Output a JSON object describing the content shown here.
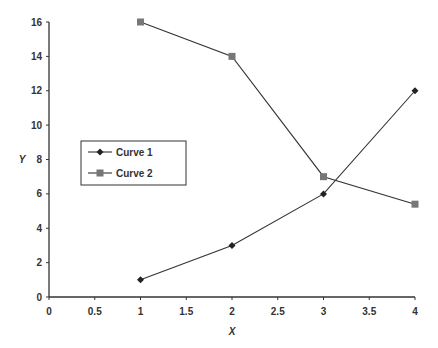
{
  "chart_data": {
    "type": "line",
    "title": "",
    "xlabel": "X",
    "ylabel": "Y",
    "xlim": [
      0,
      4
    ],
    "ylim": [
      0,
      16
    ],
    "x_ticks": [
      "0",
      "0.5",
      "1",
      "1.5",
      "2",
      "2.5",
      "3",
      "3.5",
      "4"
    ],
    "y_ticks": [
      "0",
      "2",
      "4",
      "6",
      "8",
      "10",
      "12",
      "14",
      "16"
    ],
    "grid": false,
    "legend_position": "inside-left",
    "series": [
      {
        "name": "Curve 1",
        "marker": "diamond",
        "x": [
          1,
          2,
          3,
          4
        ],
        "values": [
          1,
          3,
          6,
          12
        ]
      },
      {
        "name": "Curve 2",
        "marker": "square",
        "x": [
          1,
          2,
          3,
          4
        ],
        "values": [
          16,
          14,
          7,
          5.4
        ]
      }
    ]
  },
  "colors": {
    "axis": "#333333",
    "line": "#333333",
    "curve1_marker": "#222222",
    "curve2_marker": "#777777"
  }
}
